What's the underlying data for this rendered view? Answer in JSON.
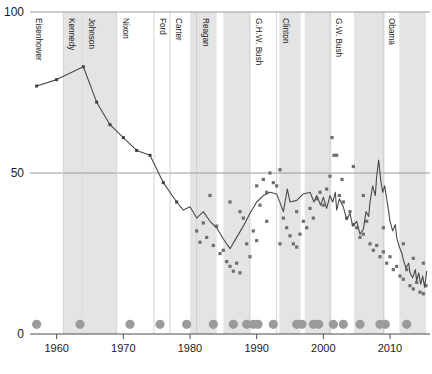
{
  "chart_data": {
    "type": "line",
    "title": "",
    "xlabel": "",
    "ylabel": "",
    "xlim": [
      1956,
      2016
    ],
    "ylim": [
      0,
      100
    ],
    "grid": true,
    "legend_position": "none",
    "x_ticks": [
      1960,
      1970,
      1980,
      1990,
      2000,
      2010
    ],
    "x_tick_labels": [
      "1960",
      "1970",
      "1980",
      "1990",
      "2000",
      "2010"
    ],
    "y_ticks": [
      0,
      50,
      100
    ],
    "y_tick_labels": [
      "0",
      "50",
      "100"
    ],
    "gridlines_at": [
      50,
      100
    ],
    "administrations": [
      {
        "name": "Eisenhower",
        "start": 1956,
        "end": 1961,
        "shaded": false
      },
      {
        "name": "Kennedy",
        "start": 1961,
        "end": 1963.9,
        "shaded": true
      },
      {
        "name": "Johnson",
        "start": 1963.9,
        "end": 1969,
        "shaded": true
      },
      {
        "name": "Nixon",
        "start": 1969,
        "end": 1974.6,
        "shaded": false
      },
      {
        "name": "Ford",
        "start": 1974.6,
        "end": 1977,
        "shaded": false
      },
      {
        "name": "Carter",
        "start": 1977,
        "end": 1981,
        "shaded": false
      },
      {
        "name": "Reagan",
        "start": 1981,
        "end": 1989,
        "shaded": true
      },
      {
        "name": "G.H.W. Bush",
        "start": 1989,
        "end": 1993,
        "shaded": false
      },
      {
        "name": "Clinton",
        "start": 1993,
        "end": 2001,
        "shaded": false
      },
      {
        "name": "G.W. Bush",
        "start": 2001,
        "end": 2009,
        "shaded": true
      },
      {
        "name": "Obama",
        "start": 2009,
        "end": 2016,
        "shaded": true
      }
    ],
    "shaded_bands": [
      {
        "start": 1961.0,
        "end": 1963.8
      },
      {
        "start": 1964.0,
        "end": 1969.0
      },
      {
        "start": 1980.0,
        "end": 1984.0
      },
      {
        "start": 1985.0,
        "end": 1989.0
      },
      {
        "start": 1993.4,
        "end": 1996.6
      },
      {
        "start": 1997.2,
        "end": 2001.2
      },
      {
        "start": 2004.6,
        "end": 2009.2
      },
      {
        "start": 2011.4,
        "end": 2015.4
      }
    ],
    "series": [
      {
        "name": "trend",
        "points": [
          [
            1957.0,
            77.0
          ],
          [
            1960.0,
            79.0
          ],
          [
            1964.0,
            83.0
          ],
          [
            1966.0,
            72.0
          ],
          [
            1968.0,
            65.0
          ],
          [
            1970.0,
            61.0
          ],
          [
            1972.0,
            57.0
          ],
          [
            1974.0,
            55.5
          ],
          [
            1976.0,
            47.0
          ],
          [
            1978.0,
            41.0
          ],
          [
            1979.0,
            38.5
          ],
          [
            1980.0,
            39.5
          ],
          [
            1981.0,
            36.0
          ],
          [
            1982.0,
            38.0
          ],
          [
            1983.0,
            35.0
          ],
          [
            1984.0,
            33.0
          ],
          [
            1985.0,
            29.5
          ],
          [
            1986.0,
            26.5
          ],
          [
            1987.0,
            30.0
          ],
          [
            1988.0,
            33.5
          ],
          [
            1989.0,
            37.5
          ],
          [
            1990.0,
            41.0
          ],
          [
            1991.0,
            43.0
          ],
          [
            1992.0,
            44.0
          ],
          [
            1993.0,
            43.5
          ],
          [
            1994.0,
            38.0
          ],
          [
            1994.6,
            45.0
          ],
          [
            1995.0,
            41.0
          ],
          [
            1996.0,
            41.5
          ],
          [
            1997.0,
            43.5
          ],
          [
            1998.0,
            44.0
          ],
          [
            1998.6,
            41.0
          ],
          [
            1999.0,
            43.0
          ],
          [
            1999.6,
            40.0
          ],
          [
            2000.0,
            42.5
          ],
          [
            2000.5,
            39.0
          ],
          [
            2001.0,
            43.0
          ],
          [
            2001.4,
            41.0
          ],
          [
            2001.8,
            44.0
          ],
          [
            2002.0,
            38.5
          ],
          [
            2002.4,
            42.0
          ],
          [
            2003.0,
            39.5
          ],
          [
            2003.5,
            35.5
          ],
          [
            2004.0,
            37.5
          ],
          [
            2004.4,
            33.5
          ],
          [
            2005.0,
            35.0
          ],
          [
            2005.5,
            31.0
          ],
          [
            2006.0,
            32.5
          ],
          [
            2006.4,
            38.0
          ],
          [
            2006.8,
            36.5
          ],
          [
            2007.0,
            41.0
          ],
          [
            2007.4,
            46.0
          ],
          [
            2007.8,
            43.0
          ],
          [
            2008.0,
            49.0
          ],
          [
            2008.3,
            54.0
          ],
          [
            2008.6,
            48.0
          ],
          [
            2008.9,
            44.0
          ],
          [
            2009.2,
            46.0
          ],
          [
            2009.5,
            42.0
          ],
          [
            2009.8,
            38.0
          ],
          [
            2010.0,
            35.0
          ],
          [
            2010.4,
            32.0
          ],
          [
            2010.8,
            34.0
          ],
          [
            2011.0,
            30.0
          ],
          [
            2011.4,
            27.0
          ],
          [
            2011.8,
            25.0
          ],
          [
            2012.0,
            23.0
          ],
          [
            2012.4,
            20.5
          ],
          [
            2012.8,
            22.0
          ],
          [
            2013.0,
            19.0
          ],
          [
            2013.4,
            17.5
          ],
          [
            2013.8,
            20.0
          ],
          [
            2014.0,
            16.5
          ],
          [
            2014.3,
            19.0
          ],
          [
            2014.6,
            15.5
          ],
          [
            2014.9,
            18.0
          ],
          [
            2015.2,
            14.5
          ],
          [
            2015.5,
            19.5
          ]
        ]
      }
    ],
    "scatter_points": [
      [
        1981.0,
        32.0
      ],
      [
        1981.5,
        28.5
      ],
      [
        1982.0,
        34.5
      ],
      [
        1982.5,
        30.0
      ],
      [
        1983.0,
        43.0
      ],
      [
        1983.5,
        27.5
      ],
      [
        1984.0,
        33.5
      ],
      [
        1984.5,
        25.0
      ],
      [
        1985.0,
        26.0
      ],
      [
        1985.5,
        22.5
      ],
      [
        1986.0,
        21.0
      ],
      [
        1986.5,
        19.5
      ],
      [
        1987.0,
        22.0
      ],
      [
        1987.5,
        19.0
      ],
      [
        1988.0,
        36.0
      ],
      [
        1988.5,
        28.0
      ],
      [
        1989.0,
        24.0
      ],
      [
        1989.5,
        32.0
      ],
      [
        1990.0,
        46.0
      ],
      [
        1990.5,
        40.0
      ],
      [
        1991.0,
        48.0
      ],
      [
        1991.5,
        44.0
      ],
      [
        1992.0,
        50.0
      ],
      [
        1992.5,
        47.0
      ],
      [
        1993.0,
        46.0
      ],
      [
        1993.5,
        51.0
      ],
      [
        1994.0,
        36.0
      ],
      [
        1994.5,
        33.0
      ],
      [
        1995.0,
        30.5
      ],
      [
        1995.5,
        28.0
      ],
      [
        1996.0,
        27.0
      ],
      [
        1996.5,
        31.0
      ],
      [
        1997.0,
        35.0
      ],
      [
        1997.5,
        33.0
      ],
      [
        1998.0,
        39.0
      ],
      [
        1998.5,
        36.0
      ],
      [
        1999.0,
        42.0
      ],
      [
        1999.5,
        44.0
      ],
      [
        2000.0,
        40.0
      ],
      [
        2000.5,
        45.0
      ],
      [
        2001.0,
        49.0
      ],
      [
        2001.3,
        61.0
      ],
      [
        2001.6,
        55.5
      ],
      [
        2002.0,
        55.5
      ],
      [
        2002.4,
        43.0
      ],
      [
        2002.8,
        48.0
      ],
      [
        2003.0,
        41.0
      ],
      [
        2003.5,
        36.0
      ],
      [
        2004.0,
        38.0
      ],
      [
        2004.5,
        34.0
      ],
      [
        2005.0,
        33.0
      ],
      [
        2005.5,
        30.0
      ],
      [
        2006.0,
        31.0
      ],
      [
        2006.5,
        35.0
      ],
      [
        2007.0,
        28.0
      ],
      [
        2007.5,
        26.0
      ],
      [
        2008.0,
        27.5
      ],
      [
        2008.5,
        24.0
      ],
      [
        2009.0,
        25.5
      ],
      [
        2009.5,
        22.0
      ],
      [
        2010.0,
        24.0
      ],
      [
        2010.5,
        20.0
      ],
      [
        2011.0,
        21.0
      ],
      [
        2011.5,
        18.0
      ],
      [
        2012.0,
        17.0
      ],
      [
        2012.5,
        20.0
      ],
      [
        2013.0,
        15.0
      ],
      [
        2013.5,
        14.0
      ],
      [
        2014.0,
        16.0
      ],
      [
        2014.5,
        13.0
      ],
      [
        2015.0,
        12.5
      ],
      [
        2015.4,
        15.0
      ],
      [
        1986.0,
        41.0
      ],
      [
        1987.5,
        38.0
      ],
      [
        1990.0,
        29.0
      ],
      [
        1991.5,
        35.0
      ],
      [
        1993.5,
        28.0
      ],
      [
        1996.0,
        38.0
      ],
      [
        2004.5,
        52.0
      ],
      [
        2006.0,
        43.0
      ],
      [
        2009.0,
        33.0
      ],
      [
        2012.0,
        28.0
      ],
      [
        2013.5,
        23.5
      ],
      [
        2015.0,
        22.0
      ]
    ],
    "event_dots": {
      "y_value": 3.0,
      "x_values": [
        1957.0,
        1963.5,
        1971.0,
        1975.5,
        1979.5,
        1983.5,
        1986.5,
        1988.5,
        1989.5,
        1990.2,
        1992.5,
        1996.0,
        1996.8,
        1998.5,
        1999.3,
        2001.5,
        2003.0,
        2005.5,
        2008.5,
        2009.3,
        2012.5
      ]
    }
  },
  "axis": {
    "y_label_top": "100",
    "y_label_mid": "50",
    "y_label_bottom": "0"
  }
}
